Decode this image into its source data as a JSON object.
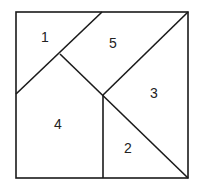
{
  "diagram": {
    "type": "dissected-square",
    "stroke_color": "#1a1a1a",
    "stroke_width": 1.6,
    "square": {
      "x1": 16,
      "y1": 12,
      "x2": 188,
      "y2": 178
    },
    "lines": [
      {
        "name": "top-to-left-diagonal",
        "x1": 102,
        "y1": 12,
        "x2": 16,
        "y2": 94
      },
      {
        "name": "inner-diagonal",
        "x1": 60,
        "y1": 54,
        "x2": 188,
        "y2": 178
      },
      {
        "name": "center-to-top-right",
        "x1": 103,
        "y1": 95,
        "x2": 188,
        "y2": 12
      },
      {
        "name": "center-vertical",
        "x1": 103,
        "y1": 95,
        "x2": 103,
        "y2": 178
      }
    ],
    "pieces": [
      {
        "id": "piece-1",
        "label": "1",
        "x": 45,
        "y": 37
      },
      {
        "id": "piece-5",
        "label": "5",
        "x": 113,
        "y": 43
      },
      {
        "id": "piece-3",
        "label": "3",
        "x": 154,
        "y": 93
      },
      {
        "id": "piece-4",
        "label": "4",
        "x": 58,
        "y": 124
      },
      {
        "id": "piece-2",
        "label": "2",
        "x": 128,
        "y": 148
      }
    ]
  }
}
